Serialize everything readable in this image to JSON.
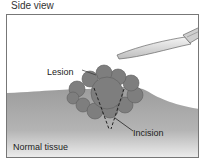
{
  "diagram": {
    "title": "Side view",
    "labels": {
      "lesion": "Lesion",
      "incision": "Incision",
      "normal_tissue": "Normal tissue"
    },
    "elements": [
      "scalpel",
      "lesion",
      "tissue",
      "incision-lines"
    ],
    "colors": {
      "tissue_top": "#9a9a9a",
      "tissue_bottom": "#ececec",
      "lesion": "#7d7d7d",
      "scalpel": "#dcdcdc",
      "frame": "#777777"
    }
  }
}
